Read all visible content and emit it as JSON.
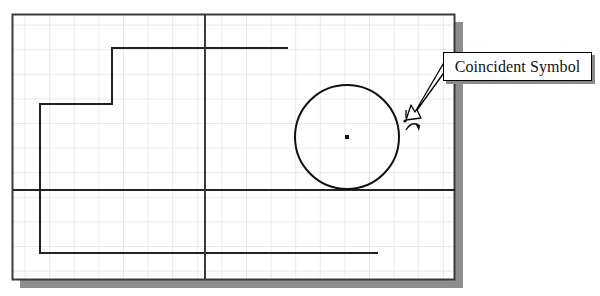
{
  "document": {
    "type": "cad-sketch-screenshot",
    "background_color": "#ffffff"
  },
  "drawing_area": {
    "name": "grid-paper-canvas",
    "x": 12,
    "y": 14,
    "width": 443,
    "height": 266,
    "background_color": "#ffffff",
    "border_color": "#3a3a3a",
    "shadow_color": "#8a8a8a",
    "grid": {
      "spacing": 24.6,
      "line_color": "#d2d2d2",
      "visible": true
    }
  },
  "sketch": {
    "stepped_profile": {
      "name": "stepped-profile-polyline",
      "stroke_color": "#222222",
      "stroke_width": 2,
      "points": "288,48 112,48 112,104 40,104 40,253 378,253"
    },
    "horizontal_datum_line": {
      "name": "horizontal-datum-line",
      "stroke_color": "#222222",
      "stroke_width": 2,
      "x1": 13,
      "y1": 190,
      "x2": 455,
      "y2": 190
    },
    "vertical_datum_line": {
      "name": "vertical-datum-line",
      "stroke_color": "#3a3a3a",
      "stroke_width": 2,
      "x1": 205,
      "y1": 15,
      "x2": 205,
      "y2": 279
    },
    "circle": {
      "name": "sketch-circle",
      "center_x": 347,
      "center_y": 137,
      "radius": 52,
      "stroke_color": "#111111",
      "stroke_width": 2,
      "center_point_visible": true,
      "center_point_size": 4
    },
    "coincident_symbol": {
      "name": "coincident-constraint-symbol",
      "x": 404,
      "y": 112,
      "stroke_color": "#111111",
      "description": "small cross and arc constraint glyph on circle edge"
    }
  },
  "callout": {
    "label": "Coincident Symbol",
    "box": {
      "x": 443,
      "y": 52,
      "width": 149,
      "height": 29,
      "fill": "#ffffff",
      "border_color": "#000000",
      "shadow_color": "#8a8a8a"
    },
    "leader_arrow": {
      "name": "callout-leader-arrow",
      "from_x": 446,
      "from_y": 59,
      "to_x": 410,
      "to_y": 118,
      "style": "hollow-outlined",
      "fill": "#ffffff",
      "stroke_color": "#000000"
    }
  }
}
